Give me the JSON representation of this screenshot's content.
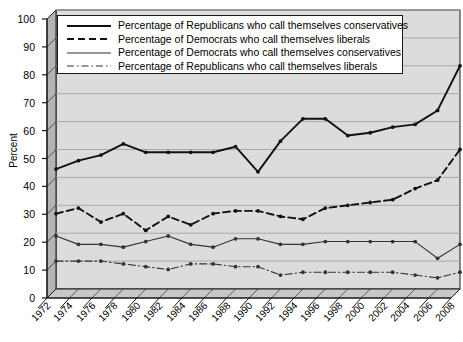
{
  "chart_data": {
    "type": "line",
    "title": "",
    "xlabel": "",
    "ylabel": "Percent",
    "ylim": [
      0,
      100
    ],
    "ytick_step": 10,
    "yticks": [
      0,
      10,
      20,
      30,
      40,
      50,
      60,
      70,
      80,
      90,
      100
    ],
    "grid": true,
    "legend_position": "top-left-inside",
    "categories": [
      1972,
      1974,
      1976,
      1978,
      1980,
      1982,
      1984,
      1986,
      1988,
      1990,
      1992,
      1994,
      1996,
      1998,
      2000,
      2002,
      2004,
      2006,
      2008
    ],
    "xtick_labels": [
      "1972",
      "1974",
      "1976",
      "1978",
      "1980",
      "1982",
      "1984",
      "1986",
      "1988",
      "1990",
      "1992",
      "1994",
      "1996",
      "1998",
      "2000",
      "2002",
      "2004",
      "2006",
      "2008"
    ],
    "series": [
      {
        "name": "Percentage of Republicans who call themselves conservatives",
        "style": "solid-thick",
        "color": "#111111",
        "values": [
          43,
          46,
          48,
          52,
          49,
          49,
          49,
          49,
          51,
          42,
          53,
          61,
          61,
          55,
          56,
          58,
          59,
          64,
          80
        ]
      },
      {
        "name": "Percentage of Democrats who call themselves liberals",
        "style": "dashed",
        "color": "#111111",
        "values": [
          27,
          29,
          24,
          27,
          21,
          26,
          23,
          27,
          28,
          28,
          26,
          25,
          29,
          30,
          31,
          32,
          36,
          39,
          50
        ]
      },
      {
        "name": "Percentage of Democrats who call themselves conservatives",
        "style": "solid-thin",
        "color": "#333333",
        "values": [
          19,
          16,
          16,
          15,
          17,
          19,
          16,
          15,
          18,
          18,
          16,
          16,
          17,
          17,
          17,
          17,
          17,
          11,
          16
        ]
      },
      {
        "name": "Percentage of Republicans who call themselves liberals",
        "style": "dash-dot",
        "color": "#333333",
        "values": [
          10,
          10,
          10,
          9,
          8,
          7,
          9,
          9,
          8,
          8,
          5,
          6,
          6,
          6,
          6,
          6,
          5,
          4,
          6
        ]
      }
    ],
    "legend_entries": [
      "Percentage of Republicans who call themselves conservatives",
      "Percentage of Democrats who call themselves liberals",
      "Percentage of Democrats who call themselves conservatives",
      "Percentage of Republicans who call themselves liberals"
    ]
  },
  "colors": {
    "plot_background": "#dcdcdc",
    "wall_left": "#b4b4b4",
    "floor": "#c8c8c8",
    "gridline": "#a8a8a8",
    "axis": "#1a1a1a",
    "page_background": "#ffffff"
  }
}
